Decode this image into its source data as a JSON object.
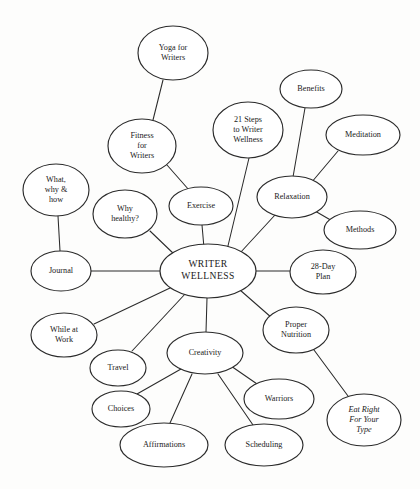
{
  "diagram": {
    "type": "mind-map",
    "background_color": "#fdfdfc",
    "line_color": "#2b2b2b",
    "node_fill": "#ffffff",
    "center": {
      "id": "writer-wellness",
      "label_lines": [
        "WRITER",
        "WELLNESS"
      ],
      "cx": 208,
      "cy": 271,
      "rx": 48,
      "ry": 27,
      "size": "lg",
      "style": "caps"
    },
    "nodes": [
      {
        "id": "yoga-for-writers",
        "label_lines": [
          "Yoga for",
          "Writers"
        ],
        "cx": 173,
        "cy": 53,
        "rx": 35,
        "ry": 27,
        "size": "sm"
      },
      {
        "id": "fitness-for-writers",
        "label_lines": [
          "Fitness",
          "for",
          "Writers"
        ],
        "cx": 142,
        "cy": 146,
        "rx": 34,
        "ry": 27,
        "size": "sm"
      },
      {
        "id": "twenty-one-steps-to-writer-wellness",
        "label_lines": [
          "21 Steps",
          "to Writer",
          "Wellness"
        ],
        "cx": 248,
        "cy": 130,
        "rx": 35,
        "ry": 28,
        "size": "sm"
      },
      {
        "id": "benefits",
        "label_lines": [
          "Benefits"
        ],
        "cx": 311,
        "cy": 89,
        "rx": 31,
        "ry": 19,
        "size": "sm"
      },
      {
        "id": "meditation",
        "label_lines": [
          "Meditation"
        ],
        "cx": 363,
        "cy": 135,
        "rx": 37,
        "ry": 20,
        "size": "sm"
      },
      {
        "id": "relaxation",
        "label_lines": [
          "Relaxation"
        ],
        "cx": 292,
        "cy": 197,
        "rx": 35,
        "ry": 21,
        "size": "sm"
      },
      {
        "id": "methods",
        "label_lines": [
          "Methods"
        ],
        "cx": 360,
        "cy": 230,
        "rx": 36,
        "ry": 19,
        "size": "sm"
      },
      {
        "id": "twenty-eight-day-plan",
        "label_lines": [
          "28-Day",
          "Plan"
        ],
        "cx": 323,
        "cy": 272,
        "rx": 33,
        "ry": 22,
        "size": "sm"
      },
      {
        "id": "exercise",
        "label_lines": [
          "Exercise"
        ],
        "cx": 201,
        "cy": 206,
        "rx": 32,
        "ry": 19,
        "size": "sm"
      },
      {
        "id": "why-healthy",
        "label_lines": [
          "Why",
          "healthy?"
        ],
        "cx": 125,
        "cy": 214,
        "rx": 32,
        "ry": 24,
        "size": "sm"
      },
      {
        "id": "what-why-and-how",
        "label_lines": [
          "What,",
          "why &",
          "how"
        ],
        "cx": 56,
        "cy": 190,
        "rx": 33,
        "ry": 26,
        "size": "sm"
      },
      {
        "id": "journal",
        "label_lines": [
          "Journal"
        ],
        "cx": 61,
        "cy": 271,
        "rx": 30,
        "ry": 20,
        "size": "sm"
      },
      {
        "id": "while-at-work",
        "label_lines": [
          "While at",
          "Work"
        ],
        "cx": 64,
        "cy": 335,
        "rx": 33,
        "ry": 22,
        "size": "sm"
      },
      {
        "id": "travel",
        "label_lines": [
          "Travel"
        ],
        "cx": 118,
        "cy": 368,
        "rx": 28,
        "ry": 18,
        "size": "sm"
      },
      {
        "id": "choices",
        "label_lines": [
          "Choices"
        ],
        "cx": 121,
        "cy": 409,
        "rx": 29,
        "ry": 18,
        "size": "sm"
      },
      {
        "id": "affirmations",
        "label_lines": [
          "Affirmations"
        ],
        "cx": 164,
        "cy": 445,
        "rx": 44,
        "ry": 22,
        "size": "sm"
      },
      {
        "id": "creativity",
        "label_lines": [
          "Creativity"
        ],
        "cx": 205,
        "cy": 353,
        "rx": 38,
        "ry": 21,
        "size": "sm"
      },
      {
        "id": "scheduling",
        "label_lines": [
          "Scheduling"
        ],
        "cx": 264,
        "cy": 445,
        "rx": 39,
        "ry": 21,
        "size": "sm"
      },
      {
        "id": "warriors",
        "label_lines": [
          "Warriors"
        ],
        "cx": 279,
        "cy": 399,
        "rx": 35,
        "ry": 20,
        "size": "sm"
      },
      {
        "id": "proper-nutrition",
        "label_lines": [
          "Proper",
          "Nutrition"
        ],
        "cx": 296,
        "cy": 330,
        "rx": 33,
        "ry": 23,
        "size": "sm"
      },
      {
        "id": "eat-right-for-your-type",
        "label_lines": [
          "Eat Right",
          "For Your",
          "Type"
        ],
        "cx": 364,
        "cy": 420,
        "rx": 37,
        "ry": 26,
        "size": "sm",
        "style": "italic"
      }
    ],
    "edges": [
      {
        "id": "edge-yoga-fitness",
        "from": "yoga-for-writers",
        "to": "fitness-for-writers",
        "x1": 163,
        "y1": 80,
        "x2": 153,
        "y2": 120
      },
      {
        "id": "edge-fitness-exercise",
        "from": "fitness-for-writers",
        "to": "exercise",
        "x1": 167,
        "y1": 165,
        "x2": 189,
        "y2": 190
      },
      {
        "id": "edge-exercise-center",
        "from": "exercise",
        "to": "writer-wellness",
        "x1": 202,
        "y1": 225,
        "x2": 204,
        "y2": 248
      },
      {
        "id": "edge-21steps-center",
        "from": "twenty-one-steps-to-writer-wellness",
        "to": "writer-wellness",
        "x1": 249,
        "y1": 158,
        "x2": 227,
        "y2": 250
      },
      {
        "id": "edge-benefits-relaxation",
        "from": "benefits",
        "to": "relaxation",
        "x1": 305,
        "y1": 108,
        "x2": 293,
        "y2": 177
      },
      {
        "id": "edge-meditation-relaxation",
        "from": "meditation",
        "to": "relaxation",
        "x1": 338,
        "y1": 151,
        "x2": 311,
        "y2": 183
      },
      {
        "id": "edge-relaxation-methods",
        "from": "relaxation",
        "to": "methods",
        "x1": 315,
        "y1": 211,
        "x2": 334,
        "y2": 222
      },
      {
        "id": "edge-relaxation-center",
        "from": "relaxation",
        "to": "writer-wellness",
        "x1": 275,
        "y1": 215,
        "x2": 240,
        "y2": 253
      },
      {
        "id": "edge-center-28day",
        "from": "writer-wellness",
        "to": "twenty-eight-day-plan",
        "x1": 256,
        "y1": 271,
        "x2": 290,
        "y2": 271
      },
      {
        "id": "edge-center-propernutrition",
        "from": "writer-wellness",
        "to": "proper-nutrition",
        "x1": 240,
        "y1": 290,
        "x2": 272,
        "y2": 318
      },
      {
        "id": "edge-propernutrition-eatright",
        "from": "proper-nutrition",
        "to": "eat-right-for-your-type",
        "x1": 314,
        "y1": 350,
        "x2": 348,
        "y2": 396
      },
      {
        "id": "edge-center-creativity",
        "from": "writer-wellness",
        "to": "creativity",
        "x1": 207,
        "y1": 298,
        "x2": 206,
        "y2": 332
      },
      {
        "id": "edge-creativity-choices",
        "from": "creativity",
        "to": "choices",
        "x1": 181,
        "y1": 369,
        "x2": 137,
        "y2": 394
      },
      {
        "id": "edge-creativity-affirmations",
        "from": "creativity",
        "to": "affirmations",
        "x1": 192,
        "y1": 374,
        "x2": 170,
        "y2": 423
      },
      {
        "id": "edge-creativity-scheduling",
        "from": "creativity",
        "to": "scheduling",
        "x1": 218,
        "y1": 374,
        "x2": 253,
        "y2": 425
      },
      {
        "id": "edge-creativity-warriors",
        "from": "creativity",
        "to": "warriors",
        "x1": 231,
        "y1": 366,
        "x2": 260,
        "y2": 386
      },
      {
        "id": "edge-center-travel",
        "from": "writer-wellness",
        "to": "travel",
        "x1": 186,
        "y1": 293,
        "x2": 132,
        "y2": 351
      },
      {
        "id": "edge-center-whileatwork",
        "from": "writer-wellness",
        "to": "while-at-work",
        "x1": 170,
        "y1": 288,
        "x2": 94,
        "y2": 324
      },
      {
        "id": "edge-center-journal",
        "from": "writer-wellness",
        "to": "journal",
        "x1": 160,
        "y1": 271,
        "x2": 91,
        "y2": 271
      },
      {
        "id": "edge-whatwhyhow-journal",
        "from": "what-why-and-how",
        "to": "journal",
        "x1": 58,
        "y1": 216,
        "x2": 60,
        "y2": 251
      },
      {
        "id": "edge-whyhealthy-center",
        "from": "why-healthy",
        "to": "writer-wellness",
        "x1": 150,
        "y1": 231,
        "x2": 175,
        "y2": 255
      }
    ]
  }
}
